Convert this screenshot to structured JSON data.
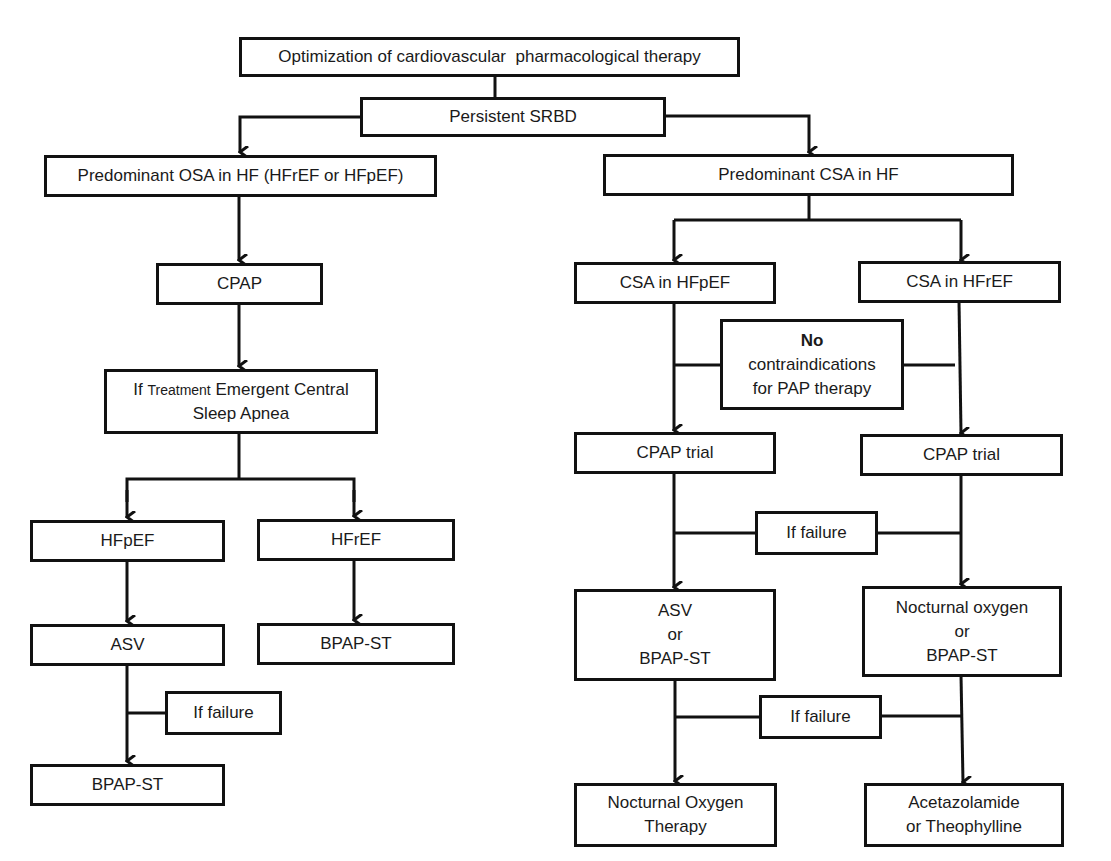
{
  "diagram": {
    "type": "flowchart",
    "nodes": {
      "top": {
        "label": "Optimization of cardiovascular  pharmacological therapy"
      },
      "persistent": {
        "label": "Persistent SRBD"
      },
      "osa": {
        "label": "Predominant OSA in HF (HFrEF or HFpEF)"
      },
      "csa": {
        "label": "Predominant CSA in HF"
      },
      "cpap_left": {
        "label": "CPAP"
      },
      "tecsa": {
        "prefix": "If ",
        "small": "Treatment",
        "rest": " Emergent Central",
        "line2": "Sleep Apnea"
      },
      "hfpef_left": {
        "label": "HFpEF"
      },
      "hfref_left": {
        "label": "HFrEF"
      },
      "asv_left": {
        "label": "ASV"
      },
      "bpap_hfref": {
        "label": "BPAP-ST"
      },
      "failure_left": {
        "label": "If failure"
      },
      "bpap_left_final": {
        "label": "BPAP-ST"
      },
      "csa_hfpef": {
        "label": "CSA in HFpEF"
      },
      "csa_hfref": {
        "label": "CSA in HFrEF"
      },
      "no_contra": {
        "line1": "No",
        "line2": "contraindications",
        "line3": "for PAP therapy"
      },
      "cpap_trial_left": {
        "label": "CPAP trial"
      },
      "cpap_trial_right": {
        "label": "CPAP trial"
      },
      "failure_mid1": {
        "label": "If failure"
      },
      "asv_or_bpap": {
        "line1": "ASV",
        "line2": "or",
        "line3": "BPAP-ST"
      },
      "noct_or_bpap": {
        "line1": "Nocturnal oxygen",
        "line2": "or",
        "line3": "BPAP-ST"
      },
      "failure_mid2": {
        "label": "If failure"
      },
      "noct_oxygen": {
        "line1": "Nocturnal Oxygen",
        "line2": "Therapy"
      },
      "acetazolamide": {
        "line1": "Acetazolamide",
        "line2": "or Theophylline"
      }
    },
    "colors": {
      "line": "#111111",
      "background": "#ffffff",
      "text": "#1a1a1a"
    }
  }
}
